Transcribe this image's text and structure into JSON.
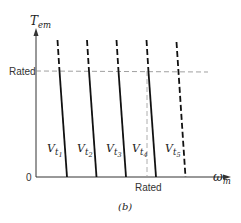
{
  "figure": {
    "caption": "(b)",
    "y_axis": {
      "label_main": "T",
      "label_sub": "em",
      "rated_label": "Rated"
    },
    "x_axis": {
      "label_main": "ω",
      "label_sub": "m",
      "rated_label": "Rated",
      "origin_label": "0"
    },
    "curves": [
      {
        "label_main": "V",
        "label_sub": "t",
        "label_subsub": "1"
      },
      {
        "label_main": "V",
        "label_sub": "t",
        "label_subsub": "2"
      },
      {
        "label_main": "V",
        "label_sub": "t",
        "label_subsub": "3"
      },
      {
        "label_main": "V",
        "label_sub": "t",
        "label_subsub": "4"
      },
      {
        "label_main": "V",
        "label_sub": "t",
        "label_subsub": "5"
      }
    ],
    "colors": {
      "line": "#111111",
      "dashed_ref": "#888888",
      "text": "#333333"
    }
  }
}
